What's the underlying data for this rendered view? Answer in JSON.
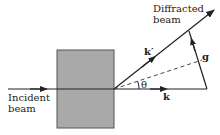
{
  "diagram": {
    "type": "diffraction-vector-diagram",
    "labels": {
      "incident_line1": "Incident",
      "incident_line2": "beam",
      "diffracted_line1": "Diffracted",
      "diffracted_line2": "beam",
      "k_prime": "k′",
      "k": "k",
      "g": "g",
      "theta": "θ"
    },
    "colors": {
      "sample_fill": "#a9a9a9",
      "sample_border": "#555555",
      "line": "#222222",
      "background": "#ffffff"
    },
    "elements": {
      "sample": "crystal-sample-block",
      "incident_vector": "k",
      "diffracted_vector": "k′",
      "scattering_vector": "g",
      "bisector": "dashed-plane-line"
    }
  }
}
